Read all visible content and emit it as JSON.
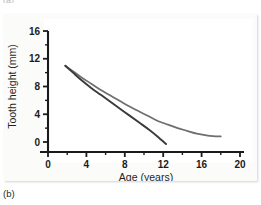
{
  "figure": {
    "panel_label_previous": "(a)",
    "panel_label": "(b)"
  },
  "chart_data": {
    "type": "line",
    "title": "",
    "xlabel": "Age (years)",
    "ylabel": "Tooth height (mm)",
    "xlim": [
      0,
      20
    ],
    "ylim": [
      0,
      16
    ],
    "xticks": [
      0,
      4,
      8,
      12,
      16,
      20
    ],
    "xtick_labels": [
      "0",
      "4",
      "8",
      "12",
      "16",
      "20"
    ],
    "yticks": [
      0,
      4,
      8,
      12,
      16
    ],
    "ytick_labels": [
      "0",
      "4",
      "8",
      "12",
      "16"
    ],
    "x_minor_ticks": [
      2,
      6,
      10,
      14,
      18
    ],
    "y_minor_ticks": [
      2,
      6,
      10,
      14
    ],
    "grid": false,
    "legend": null,
    "series": [
      {
        "name": "upper-curve",
        "color": "#6e6e6e",
        "line_width": 1.7,
        "x": [
          1.8,
          2.6,
          3.5,
          4.5,
          5.5,
          6.5,
          7.5,
          8.5,
          9.5,
          10.5,
          11.5,
          12.5,
          13.5,
          14.5,
          15.5,
          16.5,
          17.2,
          18.0
        ],
        "y": [
          11.0,
          10.2,
          9.3,
          8.4,
          7.5,
          6.7,
          5.9,
          5.1,
          4.4,
          3.7,
          3.0,
          2.5,
          2.0,
          1.6,
          1.2,
          0.95,
          0.85,
          0.8
        ]
      },
      {
        "name": "lower-curve",
        "color": "#3a3a3a",
        "line_width": 1.9,
        "x": [
          1.8,
          2.6,
          3.5,
          4.5,
          5.5,
          6.5,
          7.5,
          8.5,
          9.5,
          10.5,
          11.4,
          12.3
        ],
        "y": [
          11.0,
          10.0,
          8.9,
          7.8,
          6.8,
          5.8,
          4.8,
          3.8,
          2.8,
          1.8,
          0.8,
          -0.3
        ]
      }
    ],
    "annotations": []
  },
  "colors": {
    "axis": "#1a1a1a",
    "panel_background": "#fbfbfa",
    "plot_background": "#ffffff"
  }
}
